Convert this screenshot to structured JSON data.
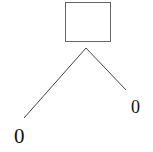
{
  "diagram": {
    "type": "tree",
    "root": {
      "shape": "rectangle",
      "label": ""
    },
    "children": [
      {
        "label": "0",
        "position": "left"
      },
      {
        "label": "0",
        "position": "right"
      }
    ],
    "colors": {
      "stroke": "#555555",
      "text": "#111111",
      "background": "#ffffff"
    }
  }
}
